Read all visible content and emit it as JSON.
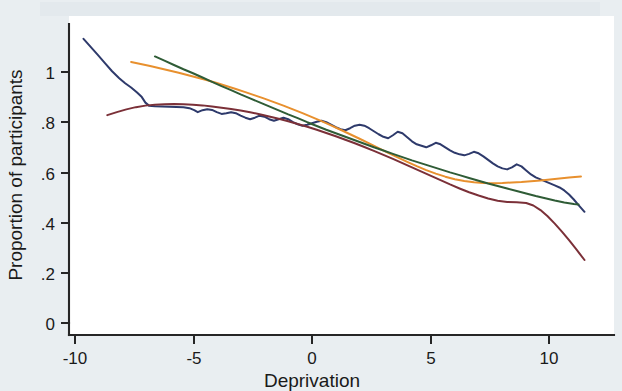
{
  "chart_data": {
    "type": "line",
    "title": "",
    "xlabel": "Deprivation",
    "ylabel": "Proportion of participants",
    "xlim": [
      -10.6,
      12.2
    ],
    "ylim": [
      -0.02,
      1.18
    ],
    "xticks": [
      -10,
      -5,
      0,
      5,
      10
    ],
    "xticklabels": [
      "-10",
      "-5",
      "0",
      "5",
      "10"
    ],
    "yticks": [
      0,
      0.2,
      0.4,
      0.6,
      0.8,
      1
    ],
    "yticklabels": [
      "0",
      ".2",
      ".4",
      ".6",
      ".8",
      "1"
    ],
    "grid": false,
    "legend": "none",
    "series": [
      {
        "name": "navy-empirical",
        "color": "#2e3a6b",
        "points": [
          [
            -9.6,
            1.132
          ],
          [
            -9.3,
            1.1
          ],
          [
            -9.0,
            1.068
          ],
          [
            -8.7,
            1.035
          ],
          [
            -8.4,
            1.003
          ],
          [
            -8.1,
            0.975
          ],
          [
            -7.85,
            0.955
          ],
          [
            -7.6,
            0.938
          ],
          [
            -7.35,
            0.918
          ],
          [
            -7.15,
            0.9
          ],
          [
            -7.0,
            0.878
          ],
          [
            -6.85,
            0.866
          ],
          [
            -6.6,
            0.864
          ],
          [
            -6.3,
            0.863
          ],
          [
            -6.0,
            0.862
          ],
          [
            -5.7,
            0.861
          ],
          [
            -5.4,
            0.86
          ],
          [
            -5.15,
            0.856
          ],
          [
            -4.95,
            0.848
          ],
          [
            -4.8,
            0.84
          ],
          [
            -4.6,
            0.848
          ],
          [
            -4.4,
            0.852
          ],
          [
            -4.2,
            0.849
          ],
          [
            -4.0,
            0.84
          ],
          [
            -3.8,
            0.833
          ],
          [
            -3.6,
            0.836
          ],
          [
            -3.4,
            0.84
          ],
          [
            -3.2,
            0.836
          ],
          [
            -3.0,
            0.826
          ],
          [
            -2.8,
            0.818
          ],
          [
            -2.6,
            0.812
          ],
          [
            -2.4,
            0.818
          ],
          [
            -2.2,
            0.826
          ],
          [
            -2.0,
            0.822
          ],
          [
            -1.8,
            0.812
          ],
          [
            -1.6,
            0.806
          ],
          [
            -1.4,
            0.812
          ],
          [
            -1.2,
            0.818
          ],
          [
            -1.0,
            0.812
          ],
          [
            -0.8,
            0.8
          ],
          [
            -0.6,
            0.792
          ],
          [
            -0.4,
            0.786
          ],
          [
            -0.2,
            0.79
          ],
          [
            0.0,
            0.796
          ],
          [
            0.2,
            0.802
          ],
          [
            0.4,
            0.806
          ],
          [
            0.6,
            0.8
          ],
          [
            0.8,
            0.79
          ],
          [
            1.0,
            0.78
          ],
          [
            1.2,
            0.772
          ],
          [
            1.4,
            0.768
          ],
          [
            1.6,
            0.776
          ],
          [
            1.8,
            0.786
          ],
          [
            2.0,
            0.79
          ],
          [
            2.2,
            0.786
          ],
          [
            2.4,
            0.776
          ],
          [
            2.6,
            0.764
          ],
          [
            2.8,
            0.752
          ],
          [
            3.0,
            0.742
          ],
          [
            3.2,
            0.736
          ],
          [
            3.4,
            0.748
          ],
          [
            3.6,
            0.762
          ],
          [
            3.8,
            0.756
          ],
          [
            4.0,
            0.74
          ],
          [
            4.2,
            0.724
          ],
          [
            4.4,
            0.712
          ],
          [
            4.6,
            0.706
          ],
          [
            4.8,
            0.7
          ],
          [
            5.0,
            0.708
          ],
          [
            5.2,
            0.718
          ],
          [
            5.4,
            0.712
          ],
          [
            5.6,
            0.7
          ],
          [
            5.8,
            0.688
          ],
          [
            6.0,
            0.678
          ],
          [
            6.2,
            0.672
          ],
          [
            6.4,
            0.668
          ],
          [
            6.6,
            0.674
          ],
          [
            6.8,
            0.682
          ],
          [
            7.0,
            0.676
          ],
          [
            7.2,
            0.664
          ],
          [
            7.4,
            0.65
          ],
          [
            7.6,
            0.636
          ],
          [
            7.8,
            0.624
          ],
          [
            8.0,
            0.616
          ],
          [
            8.2,
            0.612
          ],
          [
            8.4,
            0.62
          ],
          [
            8.6,
            0.632
          ],
          [
            8.8,
            0.624
          ],
          [
            9.0,
            0.608
          ],
          [
            9.2,
            0.592
          ],
          [
            9.4,
            0.58
          ],
          [
            9.6,
            0.572
          ],
          [
            9.8,
            0.564
          ],
          [
            10.0,
            0.556
          ],
          [
            10.2,
            0.548
          ],
          [
            10.4,
            0.54
          ],
          [
            10.6,
            0.528
          ],
          [
            10.8,
            0.512
          ],
          [
            11.0,
            0.492
          ],
          [
            11.2,
            0.47
          ],
          [
            11.45,
            0.443
          ]
        ]
      },
      {
        "name": "maroon-fit",
        "color": "#7b3038",
        "points": [
          [
            -8.6,
            0.828
          ],
          [
            -8.2,
            0.84
          ],
          [
            -7.8,
            0.851
          ],
          [
            -7.4,
            0.86
          ],
          [
            -7.0,
            0.866
          ],
          [
            -6.6,
            0.87
          ],
          [
            -6.2,
            0.872
          ],
          [
            -5.8,
            0.873
          ],
          [
            -5.4,
            0.872
          ],
          [
            -5.0,
            0.87
          ],
          [
            -4.6,
            0.867
          ],
          [
            -4.2,
            0.863
          ],
          [
            -3.8,
            0.858
          ],
          [
            -3.4,
            0.853
          ],
          [
            -3.0,
            0.847
          ],
          [
            -2.6,
            0.84
          ],
          [
            -2.2,
            0.832
          ],
          [
            -1.8,
            0.823
          ],
          [
            -1.4,
            0.814
          ],
          [
            -1.0,
            0.804
          ],
          [
            -0.6,
            0.793
          ],
          [
            -0.2,
            0.782
          ],
          [
            0.2,
            0.77
          ],
          [
            0.6,
            0.757
          ],
          [
            1.0,
            0.744
          ],
          [
            1.4,
            0.73
          ],
          [
            1.8,
            0.716
          ],
          [
            2.2,
            0.701
          ],
          [
            2.6,
            0.686
          ],
          [
            3.0,
            0.67
          ],
          [
            3.4,
            0.654
          ],
          [
            3.8,
            0.637
          ],
          [
            4.2,
            0.62
          ],
          [
            4.6,
            0.603
          ],
          [
            5.0,
            0.586
          ],
          [
            5.4,
            0.569
          ],
          [
            5.8,
            0.552
          ],
          [
            6.2,
            0.536
          ],
          [
            6.6,
            0.521
          ],
          [
            7.0,
            0.508
          ],
          [
            7.4,
            0.496
          ],
          [
            7.8,
            0.487
          ],
          [
            8.2,
            0.482
          ],
          [
            8.6,
            0.481
          ],
          [
            9.0,
            0.478
          ],
          [
            9.3,
            0.468
          ],
          [
            9.6,
            0.45
          ],
          [
            9.9,
            0.425
          ],
          [
            10.2,
            0.396
          ],
          [
            10.5,
            0.364
          ],
          [
            10.8,
            0.33
          ],
          [
            11.1,
            0.294
          ],
          [
            11.45,
            0.251
          ]
        ]
      },
      {
        "name": "orange-fit",
        "color": "#e8902e",
        "points": [
          [
            -7.6,
            1.04
          ],
          [
            -7.2,
            1.032
          ],
          [
            -6.8,
            1.024
          ],
          [
            -6.4,
            1.015
          ],
          [
            -6.0,
            1.006
          ],
          [
            -5.6,
            0.997
          ],
          [
            -5.2,
            0.987
          ],
          [
            -4.8,
            0.977
          ],
          [
            -4.4,
            0.967
          ],
          [
            -4.0,
            0.956
          ],
          [
            -3.6,
            0.944
          ],
          [
            -3.2,
            0.932
          ],
          [
            -2.8,
            0.92
          ],
          [
            -2.4,
            0.907
          ],
          [
            -2.0,
            0.894
          ],
          [
            -1.6,
            0.88
          ],
          [
            -1.2,
            0.866
          ],
          [
            -0.8,
            0.851
          ],
          [
            -0.4,
            0.836
          ],
          [
            0.0,
            0.82
          ],
          [
            0.4,
            0.804
          ],
          [
            0.8,
            0.787
          ],
          [
            1.2,
            0.77
          ],
          [
            1.6,
            0.752
          ],
          [
            2.0,
            0.734
          ],
          [
            2.4,
            0.716
          ],
          [
            2.8,
            0.697
          ],
          [
            3.2,
            0.678
          ],
          [
            3.6,
            0.66
          ],
          [
            4.0,
            0.642
          ],
          [
            4.4,
            0.625
          ],
          [
            4.8,
            0.609
          ],
          [
            5.2,
            0.595
          ],
          [
            5.6,
            0.583
          ],
          [
            6.0,
            0.573
          ],
          [
            6.4,
            0.566
          ],
          [
            6.8,
            0.561
          ],
          [
            7.2,
            0.558
          ],
          [
            7.6,
            0.557
          ],
          [
            8.0,
            0.558
          ],
          [
            8.4,
            0.56
          ],
          [
            8.8,
            0.562
          ],
          [
            9.2,
            0.565
          ],
          [
            9.6,
            0.568
          ],
          [
            10.0,
            0.572
          ],
          [
            10.4,
            0.576
          ],
          [
            10.8,
            0.58
          ],
          [
            11.3,
            0.584
          ]
        ]
      },
      {
        "name": "green-fit",
        "color": "#2f5c36",
        "points": [
          [
            -6.6,
            1.062
          ],
          [
            -6.2,
            1.045
          ],
          [
            -5.8,
            1.028
          ],
          [
            -5.4,
            1.011
          ],
          [
            -5.0,
            0.995
          ],
          [
            -4.6,
            0.978
          ],
          [
            -4.2,
            0.961
          ],
          [
            -3.8,
            0.944
          ],
          [
            -3.4,
            0.928
          ],
          [
            -3.0,
            0.911
          ],
          [
            -2.6,
            0.895
          ],
          [
            -2.2,
            0.879
          ],
          [
            -1.8,
            0.863
          ],
          [
            -1.4,
            0.847
          ],
          [
            -1.0,
            0.831
          ],
          [
            -0.6,
            0.816
          ],
          [
            -0.2,
            0.8
          ],
          [
            0.2,
            0.785
          ],
          [
            0.6,
            0.77
          ],
          [
            1.0,
            0.756
          ],
          [
            1.4,
            0.742
          ],
          [
            1.8,
            0.728
          ],
          [
            2.2,
            0.714
          ],
          [
            2.6,
            0.7
          ],
          [
            3.0,
            0.687
          ],
          [
            3.4,
            0.674
          ],
          [
            3.8,
            0.661
          ],
          [
            4.2,
            0.648
          ],
          [
            4.6,
            0.636
          ],
          [
            5.0,
            0.624
          ],
          [
            5.4,
            0.612
          ],
          [
            5.8,
            0.6
          ],
          [
            6.2,
            0.589
          ],
          [
            6.6,
            0.578
          ],
          [
            7.0,
            0.567
          ],
          [
            7.4,
            0.556
          ],
          [
            7.8,
            0.546
          ],
          [
            8.2,
            0.536
          ],
          [
            8.6,
            0.526
          ],
          [
            9.0,
            0.516
          ],
          [
            9.4,
            0.506
          ],
          [
            9.8,
            0.497
          ],
          [
            10.2,
            0.488
          ],
          [
            10.6,
            0.48
          ],
          [
            11.0,
            0.474
          ],
          [
            11.2,
            0.472
          ]
        ]
      }
    ]
  },
  "style": {
    "page_background": "#e9eef1",
    "plot_background": "#ffffff",
    "axis_color": "#262626",
    "text_color": "#1a1a1a"
  }
}
